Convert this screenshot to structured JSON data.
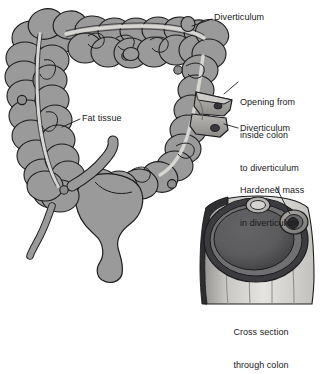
{
  "figure": {
    "background_color": "#ffffff",
    "line_color": "#1c1c1e",
    "colon_fill_color": "#9a9a9a",
    "colon_shade_color": "#7d7d7d",
    "fat_band_color": "#d8d6d2",
    "lumen_dark_color": "#4f4f51",
    "cross_section_light_color": "#cfcdc9",
    "text_color": "#18181a"
  },
  "labels": {
    "diverticulum_top": "Diverticulum",
    "fat_tissue": "Fat tissue",
    "opening_line1": "Opening from",
    "opening_line2": "inside colon",
    "opening_line3": "to diverticulum",
    "diverticulum_right": "Diverticulum",
    "hardened_line1": "Hardened mass",
    "hardened_line2": "in diverticulum",
    "cross_section_line1": "Cross section",
    "cross_section_line2": "through colon"
  },
  "parts": {
    "ascending_colon": "ascending-colon",
    "transverse_colon": "transverse-colon",
    "descending_colon": "descending-colon",
    "sigmoid_colon": "sigmoid-colon",
    "rectum": "rectum",
    "cecum": "cecum",
    "appendix": "appendix",
    "ileum": "ileum",
    "taenia_fat_band": "fat-tissue-band",
    "cutaway_window": "cutaway-window",
    "diverticulum_bump": "diverticulum-bump",
    "cross_section": "cross-section-through-colon",
    "hardened_mass": "hardened-mass"
  }
}
